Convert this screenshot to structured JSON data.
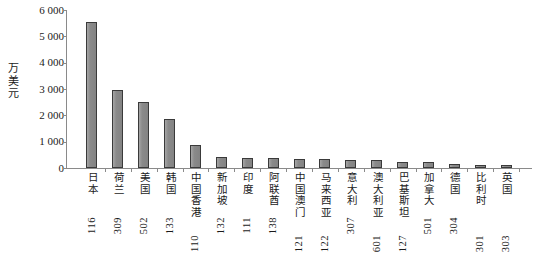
{
  "chart_data": {
    "type": "bar",
    "title": "",
    "xlabel": "",
    "ylabel": "万美元",
    "ylim": [
      0,
      6000
    ],
    "ytick_labels": [
      "6 000",
      "5 000",
      "4 000",
      "3 000",
      "2 000",
      "1 000",
      "0"
    ],
    "ytick_values": [
      6000,
      5000,
      4000,
      3000,
      2000,
      1000,
      0
    ],
    "grid": false,
    "legend": null,
    "bar_color": "#8d8d8d",
    "bar_edge_color": "#3a3a3a",
    "categories": [
      "日本",
      "荷兰",
      "美国",
      "韩国",
      "中国香港",
      "新加坡",
      "印度",
      "阿联酋",
      "中国澳门",
      "马来西亚",
      "意大利",
      "澳大利亚",
      "巴基斯坦",
      "加拿大",
      "德国",
      "比利时",
      "英国"
    ],
    "category_codes": [
      "116",
      "309",
      "502",
      "133",
      "110",
      "132",
      "111",
      "138",
      "121",
      "122",
      "307",
      "601",
      "127",
      "501",
      "304",
      "301",
      "303"
    ],
    "code_row": [
      0,
      0,
      0,
      0,
      1,
      0,
      0,
      0,
      1,
      1,
      0,
      1,
      1,
      0,
      0,
      1,
      1
    ],
    "values": [
      5550,
      2980,
      2510,
      1860,
      870,
      400,
      370,
      370,
      350,
      330,
      310,
      300,
      230,
      210,
      150,
      130,
      110
    ]
  }
}
